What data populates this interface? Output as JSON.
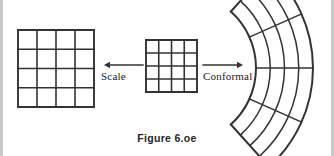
{
  "figure": {
    "caption": "Figure 6.oe",
    "background_color": "#ffffff",
    "stroke_color": "#333333",
    "border_color": "#c9c9c9"
  },
  "labels": {
    "scale": "Scale",
    "conformal": "Conformal"
  },
  "arrows": {
    "left": {
      "direction": "left",
      "from_x": 143,
      "to_x": 104,
      "y": 65
    },
    "right": {
      "direction": "right",
      "from_x": 203,
      "to_x": 243,
      "y": 65
    }
  },
  "diagram_data": {
    "type": "diagram",
    "description": "A small square grid in the center maps to a larger square grid on the left via Scale, and to a curved annular-sector grid on the right via Conformal transformation.",
    "shapes": [
      {
        "name": "source-grid",
        "kind": "square-grid",
        "rows": 4,
        "columns": 4,
        "x": 146,
        "y": 40,
        "width": 51,
        "height": 52
      },
      {
        "name": "scaled-grid",
        "kind": "square-grid",
        "rows": 4,
        "columns": 4,
        "x": 18,
        "y": 30,
        "width": 76,
        "height": 77
      },
      {
        "name": "conformal-grid",
        "kind": "annular-sector-grid",
        "rows": 4,
        "columns": 4,
        "center_x": 180,
        "center_y": 68,
        "inner_radius": 76,
        "outer_radius": 133,
        "start_angle_deg": -48,
        "end_angle_deg": 48
      }
    ]
  }
}
